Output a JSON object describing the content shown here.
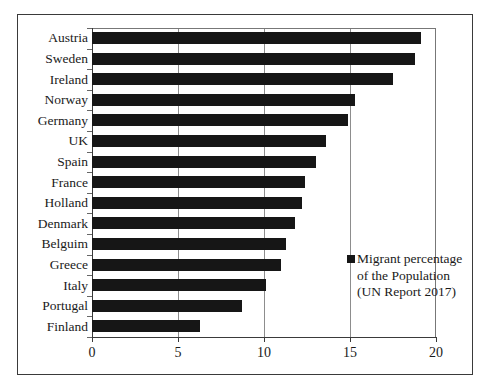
{
  "chart_data": {
    "type": "bar",
    "orientation": "horizontal",
    "title": "",
    "xlabel": "",
    "ylabel": "",
    "categories": [
      "Austria",
      "Sweden",
      "Ireland",
      "Norway",
      "Germany",
      "UK",
      "Spain",
      "France",
      "Holland",
      "Denmark",
      "Belguim",
      "Greece",
      "Italy",
      "Portugal",
      "Finland"
    ],
    "values": [
      19.1,
      18.8,
      17.5,
      15.3,
      14.9,
      13.6,
      13.0,
      12.4,
      12.2,
      11.8,
      11.3,
      11.0,
      10.1,
      8.7,
      6.3
    ],
    "series": [
      {
        "name": "Migrant percentage of the Population (UN Report 2017)",
        "values": [
          19.1,
          18.8,
          17.5,
          15.3,
          14.9,
          13.6,
          13.0,
          12.4,
          12.2,
          11.8,
          11.3,
          11.0,
          10.1,
          8.7,
          6.3
        ]
      }
    ],
    "xlim": [
      0,
      20
    ],
    "xticks": [
      "0",
      "5",
      "10",
      "15",
      "20"
    ],
    "xtick_values": [
      0,
      5,
      10,
      15,
      20
    ],
    "grid": "vertical",
    "legend_position": "inside-lower-right",
    "bar_color": "#161616",
    "gridline_color": "#8d8d8d",
    "axis_color": "#3a3a3a",
    "background_color": "#ffffff"
  },
  "legend": {
    "entries": [
      {
        "label": "Migrant percentage\nof the Population\n(UN Report 2017)",
        "color": "#161616"
      }
    ]
  },
  "frame": {
    "border_color": "#3a3a3a"
  }
}
